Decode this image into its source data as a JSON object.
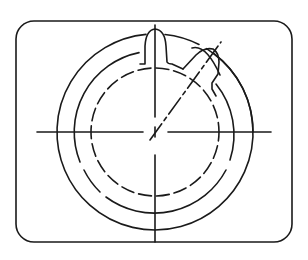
{
  "drawing": {
    "type": "technical-line-drawing",
    "subject": "circular ring part with keyway tab and angled slot, center lines and hidden (dashed) lines",
    "stroke_color": "#1a1a1a",
    "background_color": "#ffffff",
    "frame": {
      "shape": "rounded-rectangle",
      "x": 16,
      "y": 21,
      "width": 276,
      "height": 221,
      "corner_radius": 18
    },
    "center": {
      "x": 155,
      "y": 132
    },
    "circles": [
      {
        "name": "outer",
        "radius": 98,
        "style": "solid"
      },
      {
        "name": "middle",
        "radius": 81,
        "style": "solid-with-breaks"
      },
      {
        "name": "inner",
        "radius": 64,
        "style": "dashed"
      }
    ],
    "center_lines": {
      "horizontal": {
        "x1": 37,
        "x2": 271,
        "y": 132,
        "gap": [
          143,
          168
        ]
      },
      "vertical": {
        "x": 155,
        "y1": 25,
        "y2": 242,
        "gap": [
          122,
          155
        ]
      },
      "diagonal": {
        "x1": 150,
        "y1": 140,
        "x2": 221,
        "y2": 42,
        "style": "dash-dot"
      }
    },
    "features": [
      {
        "name": "keyway-tab",
        "position": "top",
        "angle_deg": 90
      },
      {
        "name": "angled-slot",
        "position": "upper-right",
        "angle_deg": 50
      }
    ]
  }
}
